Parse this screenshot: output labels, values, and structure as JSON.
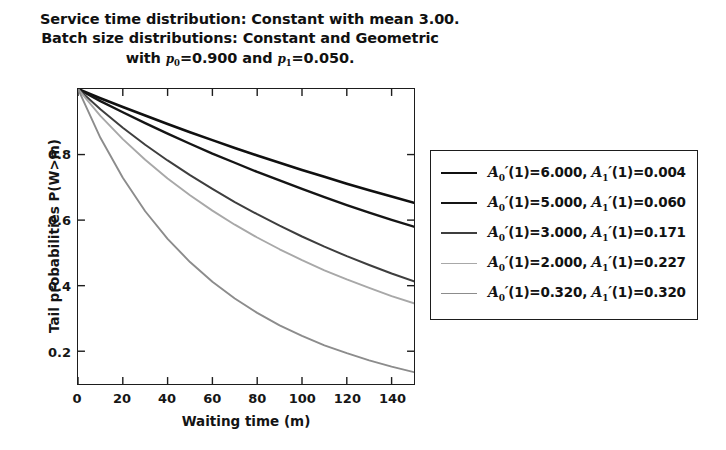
{
  "chart_data": {
    "type": "line",
    "title": "Service time distribution: Constant with mean 3.00. Batch size distributions: Constant and Geometric with p0=0.900 and p1=0.050.",
    "title_lines": [
      "Service time distribution: Constant with mean 3.00.",
      "Batch size distributions: Constant and Geometric",
      "with p0=0.900 and p1=0.050."
    ],
    "title_line1": "Service time distribution: Constant with mean 3.00.",
    "title_line2": "Batch size distributions: Constant and Geometric",
    "title_line3_pre": "with ",
    "title_line3_p0": "p",
    "title_line3_p0sub": "0",
    "title_line3_mid": "=0.900 and ",
    "title_line3_p1": "p",
    "title_line3_p1sub": "1",
    "title_line3_post": "=0.050.",
    "xlabel": "Waiting time (m)",
    "ylabel": "Tail probabilities P(W>m)",
    "xlim": [
      0,
      150
    ],
    "ylim": [
      0.1,
      1.0
    ],
    "grid": false,
    "legend_position": "right-outside",
    "xticks": [
      0,
      20,
      40,
      60,
      80,
      100,
      120,
      140
    ],
    "xtick_labels": [
      "0",
      "20",
      "40",
      "60",
      "80",
      "100",
      "120",
      "140"
    ],
    "yticks": [
      0.2,
      0.4,
      0.6,
      0.8
    ],
    "ytick_labels": [
      "0.2",
      "0.4",
      "0.6",
      "0.8"
    ],
    "x": [
      0,
      10,
      20,
      30,
      40,
      50,
      60,
      70,
      80,
      90,
      100,
      110,
      120,
      130,
      140,
      150
    ],
    "series": [
      {
        "name": "A0'(1)=6.000, A1'(1)=0.004",
        "legend_a0": "6.000",
        "legend_a1": "0.004",
        "color": "#101010",
        "width": 2.6,
        "values": [
          1.0,
          0.972,
          0.945,
          0.919,
          0.893,
          0.868,
          0.844,
          0.82,
          0.797,
          0.775,
          0.753,
          0.732,
          0.711,
          0.691,
          0.672,
          0.653
        ]
      },
      {
        "name": "A0'(1)=5.000, A1'(1)=0.060",
        "legend_a0": "5.000",
        "legend_a1": "0.060",
        "color": "#151515",
        "width": 2.4,
        "values": [
          1.0,
          0.963,
          0.929,
          0.896,
          0.864,
          0.833,
          0.803,
          0.775,
          0.747,
          0.721,
          0.695,
          0.67,
          0.646,
          0.623,
          0.601,
          0.58
        ]
      },
      {
        "name": "A0'(1)=3.000, A1'(1)=0.171",
        "legend_a0": "3.000",
        "legend_a1": "0.171",
        "color": "#3e3e3e",
        "width": 2.0,
        "values": [
          1.0,
          0.938,
          0.882,
          0.83,
          0.782,
          0.737,
          0.695,
          0.655,
          0.618,
          0.583,
          0.55,
          0.519,
          0.49,
          0.463,
          0.437,
          0.413
        ]
      },
      {
        "name": "A0'(1)=2.000, A1'(1)=0.227",
        "legend_a0": "2.000",
        "legend_a1": "0.227",
        "color": "#a8a8a8",
        "width": 1.9,
        "values": [
          1.0,
          0.918,
          0.847,
          0.784,
          0.727,
          0.676,
          0.629,
          0.586,
          0.547,
          0.511,
          0.478,
          0.447,
          0.419,
          0.393,
          0.368,
          0.346
        ]
      },
      {
        "name": "A0'(1)=0.320, A1'(1)=0.320",
        "legend_a0": "0.320",
        "legend_a1": "0.320",
        "color": "#8c8c8c",
        "width": 1.9,
        "values": [
          1.0,
          0.851,
          0.729,
          0.627,
          0.543,
          0.472,
          0.412,
          0.361,
          0.317,
          0.279,
          0.247,
          0.218,
          0.194,
          0.172,
          0.153,
          0.136
        ]
      }
    ]
  },
  "legend": {
    "rows": [
      {
        "a0": "6.000",
        "a1": "0.004"
      },
      {
        "a0": "5.000",
        "a1": "0.060"
      },
      {
        "a0": "3.000",
        "a1": "0.171"
      },
      {
        "a0": "2.000",
        "a1": "0.227"
      },
      {
        "a0": "0.320",
        "a1": "0.320"
      }
    ],
    "symbol_a": "A",
    "sub0": "0",
    "sub1": "1",
    "arg": "(1)=",
    "sep": ", "
  }
}
